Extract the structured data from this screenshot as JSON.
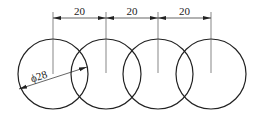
{
  "diagram": {
    "type": "technical-drawing",
    "stroke_color": "#222222",
    "background": "#ffffff",
    "circles": [
      {
        "cx": 53,
        "cy": 74,
        "r": 35
      },
      {
        "cx": 106,
        "cy": 74,
        "r": 35
      },
      {
        "cx": 158,
        "cy": 74,
        "r": 35
      },
      {
        "cx": 211,
        "cy": 74,
        "r": 35
      }
    ],
    "spacing_dimensions": [
      {
        "label": "20",
        "x1": 53,
        "x2": 106
      },
      {
        "label": "20",
        "x1": 106,
        "x2": 158
      },
      {
        "label": "20",
        "x1": 158,
        "x2": 211
      }
    ],
    "diameter_dimension": {
      "label": "ϕ28"
    }
  }
}
